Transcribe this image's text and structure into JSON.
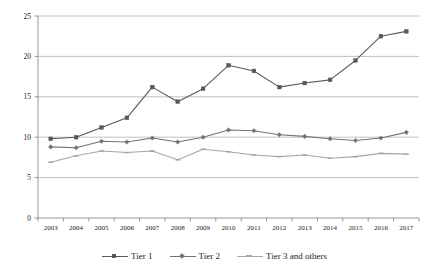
{
  "chart_data": {
    "type": "line",
    "title": "",
    "xlabel": "",
    "ylabel": "",
    "categories": [
      "2003",
      "2004",
      "2005",
      "2006",
      "2007",
      "2008",
      "2009",
      "2010",
      "2011",
      "2012",
      "2013",
      "2014",
      "2015",
      "2016",
      "2017"
    ],
    "ylim": [
      0,
      25
    ],
    "yticks": [
      0,
      5,
      10,
      15,
      20,
      25
    ],
    "grid": true,
    "legend_position": "bottom",
    "series": [
      {
        "name": "Tier 1",
        "color": "#595959",
        "marker": "square",
        "values": [
          9.8,
          10.0,
          11.2,
          12.4,
          16.2,
          14.4,
          16.0,
          18.9,
          18.2,
          16.2,
          16.7,
          17.1,
          19.5,
          22.5,
          23.1
        ]
      },
      {
        "name": "Tier 2",
        "color": "#737373",
        "marker": "diamond",
        "values": [
          8.8,
          8.7,
          9.5,
          9.4,
          9.9,
          9.4,
          10.0,
          10.9,
          10.8,
          10.3,
          10.1,
          9.8,
          9.6,
          9.9,
          10.6
        ]
      },
      {
        "name": "Tier 3 and others",
        "color": "#a6a6a6",
        "marker": "dash",
        "values": [
          6.9,
          7.7,
          8.3,
          8.1,
          8.3,
          7.2,
          8.5,
          8.2,
          7.8,
          7.6,
          7.8,
          7.4,
          7.6,
          8.0,
          7.9
        ]
      }
    ]
  },
  "legend": {
    "items": [
      {
        "label": "Tier 1"
      },
      {
        "label": "Tier 2"
      },
      {
        "label": "Tier 3 and others"
      }
    ]
  },
  "axes": {
    "y_tick_labels": [
      "0",
      "5",
      "10",
      "15",
      "20",
      "25"
    ],
    "x_tick_labels": [
      "2003",
      "2004",
      "2005",
      "2006",
      "2007",
      "2008",
      "2009",
      "2010",
      "2011",
      "2012",
      "2013",
      "2014",
      "2015",
      "2016",
      "2017"
    ]
  }
}
